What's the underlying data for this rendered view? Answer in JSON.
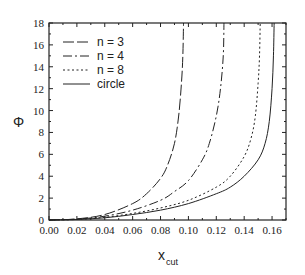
{
  "chart_data": {
    "type": "line",
    "title": "",
    "xlabel": "x_cut",
    "xlabel_main": "x",
    "xlabel_sub": "cut",
    "ylabel": "Φ",
    "xlim": [
      0.0,
      0.17
    ],
    "ylim": [
      0,
      18
    ],
    "xticks": [
      "0.00",
      "0.02",
      "0.04",
      "0.06",
      "0.08",
      "0.10",
      "0.12",
      "0.14",
      "0.16"
    ],
    "yticks": [
      "0",
      "2",
      "4",
      "6",
      "8",
      "10",
      "12",
      "14",
      "16",
      "18"
    ],
    "grid": false,
    "legend_position": "upper left",
    "series": [
      {
        "name": "n = 3",
        "style": "long-dash",
        "x": [
          0.0,
          0.02,
          0.04,
          0.06,
          0.07,
          0.08,
          0.085,
          0.09,
          0.093,
          0.095,
          0.096,
          0.0965
        ],
        "y": [
          0.0,
          0.1,
          0.5,
          1.5,
          2.4,
          3.8,
          5.0,
          7.0,
          9.5,
          12.5,
          15.0,
          18.0
        ]
      },
      {
        "name": "n = 4",
        "style": "dash-dot",
        "x": [
          0.0,
          0.02,
          0.04,
          0.06,
          0.08,
          0.09,
          0.1,
          0.11,
          0.115,
          0.12,
          0.123,
          0.125,
          0.1255
        ],
        "y": [
          0.0,
          0.08,
          0.35,
          0.9,
          1.8,
          2.6,
          3.6,
          5.5,
          7.0,
          9.5,
          12.0,
          15.0,
          18.0
        ]
      },
      {
        "name": "n = 8",
        "style": "dotted",
        "x": [
          0.0,
          0.02,
          0.04,
          0.06,
          0.08,
          0.1,
          0.12,
          0.13,
          0.14,
          0.145,
          0.148,
          0.15,
          0.151,
          0.1515
        ],
        "y": [
          0.0,
          0.05,
          0.25,
          0.6,
          1.1,
          1.8,
          3.0,
          4.0,
          5.8,
          7.5,
          9.5,
          12.5,
          15.0,
          18.0
        ]
      },
      {
        "name": "circle",
        "style": "solid",
        "x": [
          0.0,
          0.02,
          0.04,
          0.06,
          0.08,
          0.1,
          0.12,
          0.13,
          0.14,
          0.15,
          0.155,
          0.158,
          0.16,
          0.161,
          0.1615
        ],
        "y": [
          0.0,
          0.05,
          0.2,
          0.5,
          0.9,
          1.5,
          2.4,
          3.0,
          4.0,
          5.5,
          7.0,
          9.0,
          12.0,
          15.0,
          18.0
        ]
      }
    ]
  },
  "legend": {
    "items": [
      {
        "label": "n = 3"
      },
      {
        "label": "n = 4"
      },
      {
        "label": "n = 8"
      },
      {
        "label": "circle"
      }
    ]
  },
  "colors": {
    "line": "#222222",
    "background": "#ffffff"
  }
}
